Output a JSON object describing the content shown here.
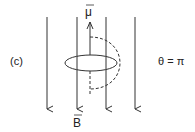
{
  "panel_label": "(c)",
  "angle_label": "θ = π",
  "mu_label": "μ",
  "b_label": "B",
  "colors": {
    "stroke": "#333333"
  }
}
